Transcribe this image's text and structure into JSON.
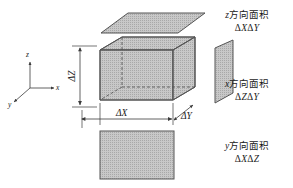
{
  "figure": {
    "background_color": "#ffffff",
    "line_color": "#4d4d4d",
    "face_fill": "#c4c4c4",
    "face_stroke": "#555555",
    "text_color": "#1a1a1a"
  },
  "axes": {
    "z_label": "z",
    "x_label": "x",
    "y_label": "y"
  },
  "dimensions": {
    "delta_z": "ΔZ",
    "delta_x": "ΔX",
    "delta_y": "ΔY"
  },
  "labels": [
    {
      "name": "z-face-label",
      "direction_letter": "z",
      "cn_text": "方向面积",
      "formula_delta1": "Δ",
      "formula_var1": "X",
      "formula_delta2": "Δ",
      "formula_var2": "Y",
      "formula_full": "ΔXΔY"
    },
    {
      "name": "x-face-label",
      "direction_letter": "x",
      "cn_text": "方向面积",
      "formula_delta1": "Δ",
      "formula_var1": "Z",
      "formula_delta2": "Δ",
      "formula_var2": "Y",
      "formula_full": "ΔZΔY"
    },
    {
      "name": "y-face-label",
      "direction_letter": "y",
      "cn_text": "方向面积",
      "formula_delta1": "Δ",
      "formula_var1": "X",
      "formula_delta2": "Δ",
      "formula_var2": "Z",
      "formula_full": "ΔXΔZ"
    }
  ],
  "shapes": {
    "top_face": "z-direction-face-parallelogram",
    "right_face": "x-direction-face-parallelogram",
    "bottom_face": "y-direction-face-rectangle",
    "box": "control-volume-box"
  }
}
